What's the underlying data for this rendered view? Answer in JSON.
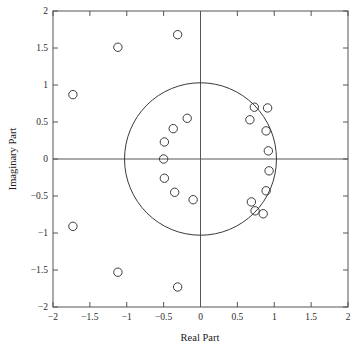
{
  "chart_data": {
    "type": "scatter",
    "title": "",
    "xlabel": "Real Part",
    "ylabel": "Imaginary Part",
    "xlim": [
      -2,
      2
    ],
    "ylim": [
      -2,
      2
    ],
    "grid": false,
    "legend": false,
    "xticks": [
      -2,
      -1.5,
      -1,
      -0.5,
      0,
      0.5,
      1,
      1.5,
      2
    ],
    "yticks": [
      -2,
      -1.5,
      -1,
      -0.5,
      0,
      0.5,
      1,
      1.5,
      2
    ],
    "xtick_labels": [
      "-2",
      "-1.5",
      "-1",
      "-0.5",
      "0",
      "0.5",
      "1",
      "1.5",
      "2"
    ],
    "ytick_labels": [
      "-2",
      "-1.5",
      "-1",
      "-0.5",
      "0",
      "0.5",
      "1",
      "1.5",
      "2"
    ],
    "marker": "open-circle",
    "marker_size": 4.2,
    "marker_color": "#3a3a3a",
    "axis_color": "#555555",
    "frame_color": "#555555",
    "reference_circle": {
      "label": "unit-circle",
      "center_x": 0,
      "center_y": 0,
      "radius": 1.03,
      "color": "#3a3a3a"
    },
    "series": [
      {
        "name": "roots",
        "points": [
          [
            -1.73,
            0.87
          ],
          [
            -1.12,
            1.51
          ],
          [
            -0.31,
            1.68
          ],
          [
            -0.18,
            0.55
          ],
          [
            -0.37,
            0.41
          ],
          [
            -0.49,
            0.23
          ],
          [
            -0.5,
            0.0
          ],
          [
            -0.49,
            -0.26
          ],
          [
            -0.35,
            -0.45
          ],
          [
            -0.1,
            -0.55
          ],
          [
            0.67,
            0.53
          ],
          [
            0.73,
            0.7
          ],
          [
            0.91,
            0.69
          ],
          [
            0.89,
            0.38
          ],
          [
            0.92,
            0.11
          ],
          [
            0.93,
            -0.16
          ],
          [
            0.89,
            -0.43
          ],
          [
            0.69,
            -0.58
          ],
          [
            0.74,
            -0.7
          ],
          [
            0.85,
            -0.74
          ],
          [
            -1.73,
            -0.91
          ],
          [
            -1.12,
            -1.53
          ],
          [
            -0.31,
            -1.73
          ]
        ]
      }
    ]
  },
  "axes": {
    "x_title": "Real Part",
    "y_title": "Imaginary Part"
  }
}
